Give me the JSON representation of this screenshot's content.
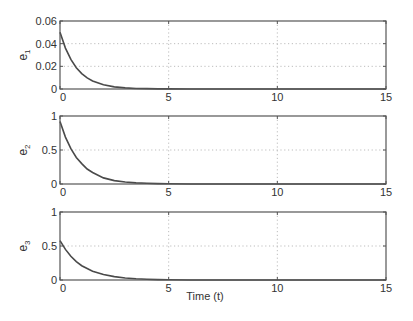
{
  "chart_data": [
    {
      "type": "line",
      "panel": 1,
      "title": "",
      "ylabel": "e1",
      "ylabel_base": "e",
      "ylabel_sub": "1",
      "xlabel": "",
      "xlim": [
        0,
        15
      ],
      "ylim": [
        0,
        0.06
      ],
      "xticks": [
        0,
        5,
        10,
        15
      ],
      "xtick_labels": [
        "0",
        "5",
        "10",
        "15"
      ],
      "yticks": [
        0,
        0.02,
        0.04,
        0.06
      ],
      "ytick_labels": [
        "0",
        "0.02",
        "0.04",
        "0.06"
      ],
      "grid": true,
      "series": [
        {
          "name": "e1",
          "color": "#4a4a4a",
          "x": [
            0,
            0.25,
            0.5,
            0.75,
            1,
            1.25,
            1.5,
            2,
            2.5,
            3,
            3.5,
            4,
            4.5,
            5,
            6,
            7,
            8,
            10,
            12,
            15
          ],
          "values": [
            0.05,
            0.0361,
            0.0261,
            0.0188,
            0.0136,
            0.0098,
            0.0071,
            0.0037,
            0.0019,
            0.001,
            0.0005,
            0.0003,
            0.0001,
            0.0001,
            0,
            0,
            0,
            0,
            0,
            0
          ]
        }
      ]
    },
    {
      "type": "line",
      "panel": 2,
      "title": "",
      "ylabel": "e2",
      "ylabel_base": "e",
      "ylabel_sub": "2",
      "xlabel": "",
      "xlim": [
        0,
        15
      ],
      "ylim": [
        0,
        1
      ],
      "xticks": [
        0,
        5,
        10,
        15
      ],
      "xtick_labels": [
        "0",
        "5",
        "10",
        "15"
      ],
      "yticks": [
        0,
        0.5,
        1
      ],
      "ytick_labels": [
        "0",
        "0.5",
        "1"
      ],
      "grid": true,
      "series": [
        {
          "name": "e2",
          "color": "#4a4a4a",
          "x": [
            0,
            0.25,
            0.5,
            0.75,
            1,
            1.25,
            1.5,
            2,
            2.5,
            3,
            3.5,
            4,
            4.5,
            5,
            6,
            7,
            8,
            10,
            12,
            15
          ],
          "values": [
            0.92,
            0.69,
            0.52,
            0.39,
            0.3,
            0.22,
            0.17,
            0.09,
            0.05,
            0.03,
            0.017,
            0.01,
            0.005,
            0.003,
            0.001,
            0,
            0,
            0,
            0,
            0
          ]
        }
      ]
    },
    {
      "type": "line",
      "panel": 3,
      "title": "",
      "ylabel": "e3",
      "ylabel_base": "e",
      "ylabel_sub": "3",
      "xlabel": "Time (t)",
      "xlim": [
        0,
        15
      ],
      "ylim": [
        0,
        1
      ],
      "xticks": [
        0,
        5,
        10,
        15
      ],
      "xtick_labels": [
        "0",
        "5",
        "10",
        "15"
      ],
      "yticks": [
        0,
        0.5,
        1
      ],
      "ytick_labels": [
        "0",
        "0.5",
        "1"
      ],
      "grid": true,
      "series": [
        {
          "name": "e3",
          "color": "#4a4a4a",
          "x": [
            0,
            0.25,
            0.5,
            0.75,
            1,
            1.25,
            1.5,
            2,
            2.5,
            3,
            3.5,
            4,
            4.5,
            5,
            6,
            7,
            8,
            10,
            12,
            15
          ],
          "values": [
            0.58,
            0.45,
            0.35,
            0.27,
            0.21,
            0.17,
            0.13,
            0.08,
            0.05,
            0.03,
            0.018,
            0.011,
            0.006,
            0.004,
            0.001,
            0,
            0,
            0,
            0,
            0
          ]
        }
      ]
    }
  ],
  "layout": {
    "panels": [
      {
        "left": 60,
        "top": 21,
        "right": 386,
        "bottom": 89
      },
      {
        "left": 60,
        "top": 116,
        "right": 386,
        "bottom": 184
      },
      {
        "left": 60,
        "top": 212,
        "right": 386,
        "bottom": 280
      }
    ]
  }
}
